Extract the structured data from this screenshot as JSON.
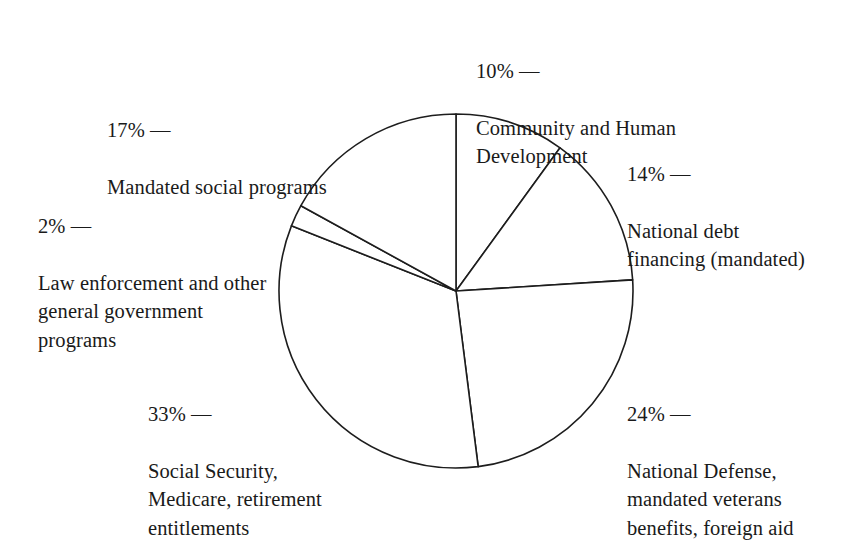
{
  "figure": {
    "background_color": "#ffffff",
    "line_color": "#1d1d1d",
    "text_color": "#1a1a1a"
  },
  "chart_data": {
    "type": "pie",
    "title": "",
    "subtitle": "",
    "xlabel": "",
    "ylabel": "",
    "legend_position": "callout-labels",
    "grid": false,
    "units": "percent",
    "start_angle_deg": 0,
    "direction": "clockwise",
    "center": {
      "x": 456,
      "y": 291,
      "radius": 177
    },
    "categories": [
      "Community and Human Development",
      "National debt financing (mandated)",
      "National Defense, mandated veterans benefits, foreign aid",
      "Social Security, Medicare, retirement entitlements",
      "Law enforcement and other general government programs",
      "Mandated social programs"
    ],
    "values": [
      10,
      14,
      24,
      33,
      2,
      17
    ],
    "slices": [
      {
        "id": "community",
        "percent": 10,
        "percent_label": "10% —",
        "label": "Community and Human\nDevelopment",
        "start_deg": 0,
        "sweep_deg": 36
      },
      {
        "id": "debt",
        "percent": 14,
        "percent_label": "14% —",
        "label": "National debt\nfinancing (mandated)",
        "start_deg": 36,
        "sweep_deg": 50.4
      },
      {
        "id": "defense",
        "percent": 24,
        "percent_label": "24% —",
        "label": "National Defense,\nmandated veterans\nbenefits, foreign aid",
        "start_deg": 86.4,
        "sweep_deg": 86.4
      },
      {
        "id": "social-security",
        "percent": 33,
        "percent_label": "33% —",
        "label": "Social Security,\nMedicare, retirement\nentitlements",
        "start_deg": 172.8,
        "sweep_deg": 118.8
      },
      {
        "id": "law-enforcement",
        "percent": 2,
        "percent_label": "2% —",
        "label": "Law enforcement and other\ngeneral government\nprograms",
        "start_deg": 291.6,
        "sweep_deg": 7.2
      },
      {
        "id": "mandated-social",
        "percent": 17,
        "percent_label": "17% —",
        "label": "Mandated social programs",
        "start_deg": 298.8,
        "sweep_deg": 61.2
      }
    ]
  }
}
